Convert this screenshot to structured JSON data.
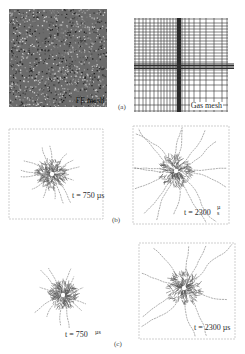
{
  "figure": {
    "row_a": {
      "sublabel": "(a)",
      "left_panel": {
        "label": "FE mesh"
      },
      "right_panel": {
        "label": "Gas mesh"
      }
    },
    "row_b": {
      "sublabel": "(b)",
      "left_panel": {
        "label": "t = 750 µs"
      },
      "right_panel": {
        "label": "t = 2300",
        "unit_stacked": "µ\ns"
      }
    },
    "row_c": {
      "sublabel": "(c)",
      "left_panel": {
        "label": "t = 750",
        "unit_stacked": "µs"
      },
      "right_panel": {
        "label": "t = 2300 µs"
      }
    }
  },
  "colors": {
    "fe_mesh_bg": "#6b6b6b",
    "mesh_line": "#2b2b2b",
    "crack": "#8a8a8a",
    "frame": "#b0b0b0"
  }
}
